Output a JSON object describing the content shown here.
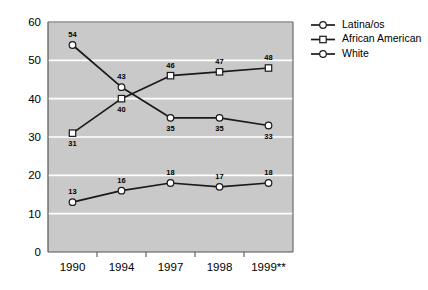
{
  "chart_data": {
    "type": "line",
    "title": "",
    "subtitle": "",
    "xlabel": "",
    "ylabel": "",
    "ylim": [
      0,
      60
    ],
    "yticks": [
      0,
      10,
      20,
      30,
      40,
      50,
      60
    ],
    "grid": true,
    "legend_position": "right",
    "categories": [
      "1990",
      "1994",
      "1997",
      "1998",
      "1999**"
    ],
    "series": [
      {
        "name": "Latina/os",
        "marker": "circle",
        "values": [
          13,
          16,
          18,
          17,
          18
        ]
      },
      {
        "name": "African American",
        "marker": "square",
        "values": [
          31,
          40,
          46,
          47,
          48
        ]
      },
      {
        "name": "White",
        "marker": "circle",
        "values": [
          54,
          43,
          35,
          35,
          33
        ]
      }
    ]
  },
  "axis": {
    "y_ticks": [
      {
        "label": "60"
      },
      {
        "label": "50"
      },
      {
        "label": "40"
      },
      {
        "label": "30"
      },
      {
        "label": "20"
      },
      {
        "label": "10"
      },
      {
        "label": "0"
      }
    ],
    "x_ticks": [
      {
        "label": "1990"
      },
      {
        "label": "1994"
      },
      {
        "label": "1997"
      },
      {
        "label": "1998"
      },
      {
        "label": "1999**"
      }
    ]
  },
  "legend": {
    "items": [
      {
        "label": "Latina/os"
      },
      {
        "label": "African American"
      },
      {
        "label": "White"
      }
    ]
  },
  "point_labels": {
    "latinaos": [
      "13",
      "16",
      "18",
      "17",
      "18"
    ],
    "african_american": [
      "31",
      "40",
      "46",
      "47",
      "48"
    ],
    "white": [
      "54",
      "43",
      "35",
      "35",
      "33"
    ]
  },
  "colors": {
    "plot_background": "#c9c9c9",
    "gridline": "#ffffff",
    "series_line": "#1a1a1a",
    "marker_fill": "#ffffff",
    "marker_stroke": "#1a1a1a",
    "axis": "#555555",
    "text": "#000000",
    "page_background": "#ffffff"
  }
}
